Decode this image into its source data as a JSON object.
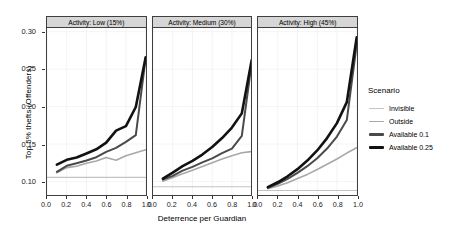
{
  "chart_data": {
    "type": "line",
    "title": "",
    "xlabel": "Deterrence per Guardian",
    "ylabel": "Top 5% thefts (Offenders)",
    "xlim": [
      0.0,
      1.0
    ],
    "ylim": [
      0.082,
      0.305
    ],
    "xticks": [
      "0.0",
      "0.2",
      "0.4",
      "0.6",
      "0.8",
      "1.0"
    ],
    "xtick_values": [
      0.0,
      0.2,
      0.4,
      0.6,
      0.8,
      1.0
    ],
    "yticks": [
      "0.10",
      "0.15",
      "0.20",
      "0.25",
      "0.30"
    ],
    "ytick_values": [
      0.1,
      0.15,
      0.2,
      0.25,
      0.3
    ],
    "grid": true,
    "legend_position": "right",
    "legend_title": "Scenario",
    "facet_variable": "Activity",
    "facets": [
      {
        "label": "Activity: Low (15%)",
        "series": [
          {
            "name": "Invisible",
            "color": "#c3c3c3",
            "width": 1.1,
            "x": [
              0.0,
              1.0
            ],
            "values": [
              0.1055,
              0.1055
            ]
          },
          {
            "name": "Outside",
            "color": "#a8a8a8",
            "width": 1.6,
            "x": [
              0.1,
              0.2,
              0.3,
              0.4,
              0.5,
              0.6,
              0.7,
              0.8,
              0.9,
              1.0
            ],
            "values": [
              0.1115,
              0.1185,
              0.1205,
              0.1245,
              0.1275,
              0.132,
              0.1285,
              0.1345,
              0.1385,
              0.1425
            ]
          },
          {
            "name": "Available 0.1",
            "color": "#4a4a4a",
            "width": 2.0,
            "x": [
              0.1,
              0.2,
              0.3,
              0.4,
              0.5,
              0.6,
              0.7,
              0.8,
              0.9,
              1.0
            ],
            "values": [
              0.113,
              0.121,
              0.1245,
              0.128,
              0.1325,
              0.1395,
              0.145,
              0.153,
              0.162,
              0.265
            ]
          },
          {
            "name": "Available 0.25",
            "color": "#121212",
            "width": 2.6,
            "x": [
              0.1,
              0.2,
              0.3,
              0.4,
              0.5,
              0.6,
              0.7,
              0.8,
              0.9,
              1.0
            ],
            "values": [
              0.1225,
              0.129,
              0.132,
              0.1375,
              0.143,
              0.152,
              0.168,
              0.174,
              0.1995,
              0.266
            ]
          }
        ]
      },
      {
        "label": "Activity: Medium (30%)",
        "series": [
          {
            "name": "Invisible",
            "color": "#c3c3c3",
            "width": 1.1,
            "x": [
              0.0,
              1.0
            ],
            "values": [
              0.093,
              0.093
            ]
          },
          {
            "name": "Outside",
            "color": "#a8a8a8",
            "width": 1.6,
            "x": [
              0.1,
              0.2,
              0.3,
              0.4,
              0.5,
              0.6,
              0.7,
              0.8,
              0.9,
              1.0
            ],
            "values": [
              0.1005,
              0.1055,
              0.1105,
              0.115,
              0.12,
              0.125,
              0.13,
              0.1345,
              0.1385,
              0.14
            ]
          },
          {
            "name": "Available 0.1",
            "color": "#4a4a4a",
            "width": 2.0,
            "x": [
              0.1,
              0.2,
              0.3,
              0.4,
              0.5,
              0.6,
              0.7,
              0.8,
              0.9,
              1.0
            ],
            "values": [
              0.1025,
              0.1075,
              0.1145,
              0.1195,
              0.1255,
              0.131,
              0.138,
              0.144,
              0.161,
              0.258
            ]
          },
          {
            "name": "Available 0.25",
            "color": "#121212",
            "width": 2.6,
            "x": [
              0.1,
              0.2,
              0.3,
              0.4,
              0.5,
              0.6,
              0.7,
              0.8,
              0.9,
              1.0
            ],
            "values": [
              0.104,
              0.112,
              0.1205,
              0.1275,
              0.136,
              0.146,
              0.158,
              0.172,
              0.191,
              0.262
            ]
          }
        ]
      },
      {
        "label": "Activity: High (45%)",
        "series": [
          {
            "name": "Invisible",
            "color": "#c3c3c3",
            "width": 1.1,
            "x": [
              0.0,
              1.0
            ],
            "values": [
              0.088,
              0.088
            ]
          },
          {
            "name": "Outside",
            "color": "#a8a8a8",
            "width": 1.6,
            "x": [
              0.1,
              0.2,
              0.3,
              0.4,
              0.5,
              0.6,
              0.7,
              0.8,
              0.9,
              1.0
            ],
            "values": [
              0.0905,
              0.094,
              0.0985,
              0.104,
              0.1095,
              0.116,
              0.123,
              0.13,
              0.138,
              0.145
            ]
          },
          {
            "name": "Available 0.1",
            "color": "#4a4a4a",
            "width": 2.0,
            "x": [
              0.1,
              0.2,
              0.3,
              0.4,
              0.5,
              0.6,
              0.7,
              0.8,
              0.9,
              1.0
            ],
            "values": [
              0.0915,
              0.097,
              0.1035,
              0.1115,
              0.1205,
              0.131,
              0.144,
              0.16,
              0.182,
              0.283
            ]
          },
          {
            "name": "Available 0.25",
            "color": "#121212",
            "width": 2.6,
            "x": [
              0.1,
              0.2,
              0.3,
              0.4,
              0.5,
              0.6,
              0.7,
              0.8,
              0.9,
              1.0
            ],
            "values": [
              0.0925,
              0.099,
              0.107,
              0.1165,
              0.128,
              0.1415,
              0.158,
              0.178,
              0.206,
              0.2925
            ]
          }
        ]
      }
    ]
  },
  "legend": {
    "title": "Scenario",
    "items": [
      {
        "label": "Invisible",
        "color": "#c3c3c3",
        "width": 1.2
      },
      {
        "label": "Outside",
        "color": "#a8a8a8",
        "width": 1.8
      },
      {
        "label": "Available 0.1",
        "color": "#4a4a4a",
        "width": 2.6
      },
      {
        "label": "Available 0.25",
        "color": "#121212",
        "width": 3.4
      }
    ]
  },
  "colors": {
    "strip_background": "#d6d6d6",
    "panel_border": "#3f3f3f",
    "grid": "#f0f0f0",
    "background": "#ffffff"
  }
}
